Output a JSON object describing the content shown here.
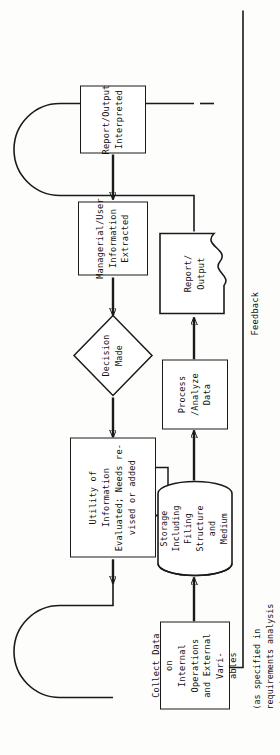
{
  "diagram": {
    "orientation": "rotated-90-ccw",
    "feedback_label": "Feedback",
    "nodes": [
      {
        "id": "collect",
        "label": "Collect Data on\nInternal Operations\nand External Vari-\nables",
        "shape": "process"
      },
      {
        "id": "storage",
        "label": "Storage\nIncluding\nFiling\nStructure\nand\nMedium",
        "shape": "cylinder"
      },
      {
        "id": "secondary",
        "label": "Secondary\nStorage",
        "shape": "circle"
      },
      {
        "id": "process",
        "label": "Process /Analyze\nData",
        "shape": "process"
      },
      {
        "id": "report",
        "label": "Report/\nOutput",
        "shape": "document"
      },
      {
        "id": "interpret",
        "label": "Report/Output\nInterpreted",
        "shape": "process"
      },
      {
        "id": "extract",
        "label": "Managerial/User\nInformation\nExtracted",
        "shape": "process"
      },
      {
        "id": "decision",
        "label": "Decision\nMade",
        "shape": "diamond"
      },
      {
        "id": "utility",
        "label": "Utility of Information\nEvaluated; Needs re-\nvised or added",
        "shape": "process"
      }
    ],
    "annotations": [
      {
        "id": "spec-note",
        "text": "(as specified in\nrequirements analysis\nstage)"
      }
    ],
    "colors": {
      "stroke": "#1a1a1a",
      "fill": "#ffffff",
      "page": "#fdfdfc"
    }
  }
}
